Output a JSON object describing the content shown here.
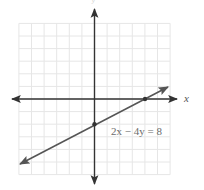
{
  "graph": {
    "equation_label": "2x − 4y = 8",
    "x_axis_label": "x",
    "y_axis_label": "y",
    "grid": {
      "x_min": -6,
      "x_max": 6,
      "y_min": -6,
      "y_max": 6,
      "spacing_px": 12.6,
      "origin_px": [
        94.5,
        99
      ],
      "grid_color": "#e6e6e6",
      "axis_color": "#333333"
    },
    "line": {
      "color": "#555555",
      "slope": 0.5,
      "y_intercept": -2,
      "from": [
        -5.9,
        -4.95
      ],
      "to": [
        5.9,
        0.95
      ]
    },
    "points": [
      {
        "label": "x-intercept",
        "x": 4,
        "y": 0
      },
      {
        "label": "y-intercept",
        "x": 0,
        "y": -2
      }
    ]
  },
  "chart_data": {
    "type": "line",
    "title": "",
    "xlabel": "x",
    "ylabel": "y",
    "xlim": [
      -6,
      6
    ],
    "ylim": [
      -6,
      6
    ],
    "grid": true,
    "series": [
      {
        "name": "2x − 4y = 8",
        "x": [
          -6,
          0,
          4,
          6
        ],
        "y": [
          -5,
          -2,
          0,
          1
        ]
      }
    ],
    "marked_points": [
      [
        4,
        0
      ],
      [
        0,
        -2
      ]
    ],
    "annotations": [
      {
        "text": "2x − 4y = 8",
        "position": [
          1.3,
          -2.8
        ]
      }
    ]
  }
}
